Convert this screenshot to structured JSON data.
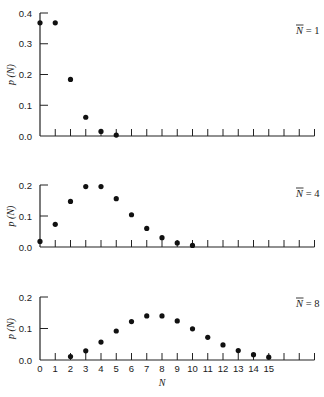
{
  "chart_data": [
    {
      "type": "scatter",
      "title": "",
      "annotation": "N̄ = 1",
      "mean": 1,
      "xlabel": "",
      "ylabel": "p (N)",
      "ylim": [
        0,
        0.4
      ],
      "yticks": [
        0.0,
        0.1,
        0.2,
        0.3,
        0.4
      ],
      "ytick_labels": [
        "0.0",
        "0.1",
        "0.2",
        "0.3",
        "0.4"
      ],
      "xlim": [
        0,
        18
      ],
      "x": [
        0,
        1,
        2,
        3,
        4,
        5
      ],
      "values": [
        0.368,
        0.368,
        0.184,
        0.061,
        0.015,
        0.003
      ],
      "grid": false
    },
    {
      "type": "scatter",
      "title": "",
      "annotation": "N̄ = 4",
      "mean": 4,
      "xlabel": "",
      "ylabel": "p (N)",
      "ylim": [
        0,
        0.2
      ],
      "yticks": [
        0.0,
        0.1,
        0.2
      ],
      "ytick_labels": [
        "0.0",
        "0.1",
        "0.2"
      ],
      "xlim": [
        0,
        18
      ],
      "x": [
        0,
        1,
        2,
        3,
        4,
        5,
        6,
        7,
        8,
        9,
        10
      ],
      "values": [
        0.018,
        0.073,
        0.147,
        0.195,
        0.195,
        0.156,
        0.104,
        0.06,
        0.03,
        0.013,
        0.005
      ],
      "grid": false
    },
    {
      "type": "scatter",
      "title": "",
      "annotation": "N̄ = 8",
      "mean": 8,
      "xlabel": "N",
      "ylabel": "p (N)",
      "ylim": [
        0,
        0.2
      ],
      "yticks": [
        0.0,
        0.1,
        0.2
      ],
      "ytick_labels": [
        "0.0",
        "0.1",
        "0.2"
      ],
      "xlim": [
        0,
        18
      ],
      "xtick_labels": [
        "0",
        "1",
        "2",
        "3",
        "4",
        "5",
        "6",
        "7",
        "8",
        "9",
        "10",
        "11",
        "12",
        "13",
        "14",
        "15"
      ],
      "x": [
        2,
        3,
        4,
        5,
        6,
        7,
        8,
        9,
        10,
        11,
        12,
        13,
        14,
        15
      ],
      "values": [
        0.011,
        0.029,
        0.057,
        0.092,
        0.122,
        0.14,
        0.14,
        0.124,
        0.099,
        0.072,
        0.048,
        0.03,
        0.017,
        0.009
      ],
      "grid": false
    }
  ],
  "labels": {
    "ylabel": "p (N)",
    "xlabel": "N",
    "panel1_annotation_value": "1",
    "panel2_annotation_value": "4",
    "panel3_annotation_value": "8",
    "annotation_symbol": "N",
    "annotation_eq": " = "
  }
}
